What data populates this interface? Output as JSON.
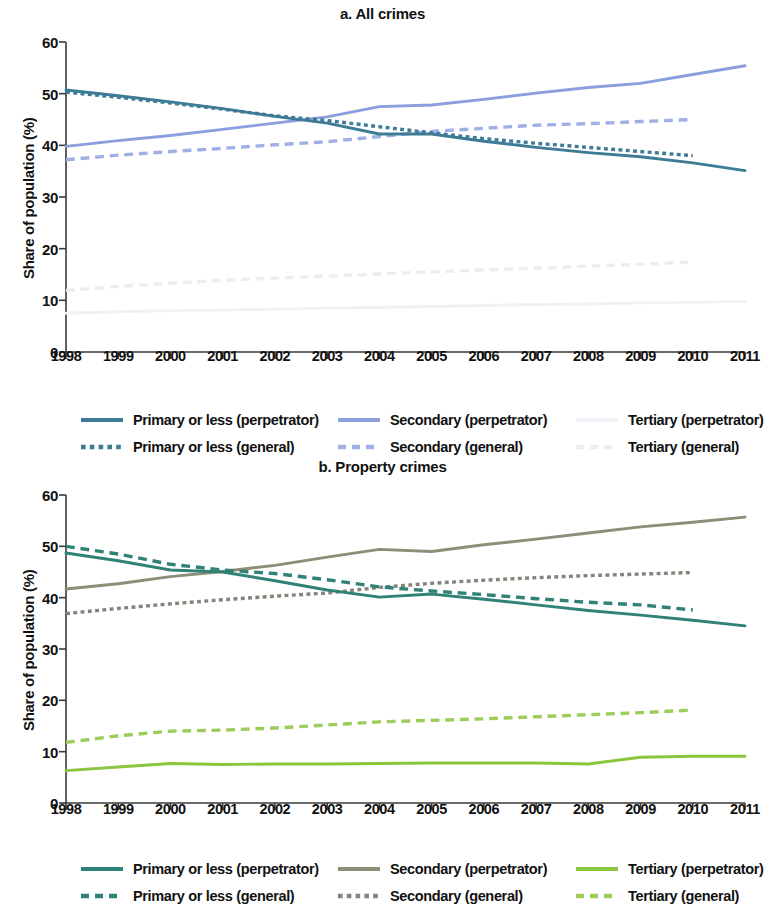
{
  "chart_data": [
    {
      "type": "line",
      "title": "a. All crimes",
      "xlabel": "",
      "ylabel": "Share of population (%)",
      "ylim": [
        0,
        60
      ],
      "yticks": [
        0,
        10,
        20,
        30,
        40,
        50,
        60
      ],
      "xlim": [
        1998,
        2011
      ],
      "categories": [
        "1998",
        "1999",
        "2000",
        "2001",
        "2002",
        "2003",
        "2004",
        "2005",
        "2006",
        "2007",
        "2008",
        "2009",
        "2010",
        "2011"
      ],
      "grid": false,
      "legend_position": "bottom",
      "colors": {
        "primary_perpetrator": "#3d7b96",
        "primary_general": "#3d7b96",
        "secondary_perpetrator": "#8b9ede",
        "secondary_general": "#9fb0e6",
        "tertiary_perpetrator": "#eef2f7",
        "tertiary_general": "#eaeef4"
      },
      "series": [
        {
          "name": "Primary or less (perpetrator)",
          "style": "solid",
          "color": "#3d7b96",
          "x": [
            1998,
            1999,
            2000,
            2001,
            2002,
            2003,
            2004,
            2005,
            2006,
            2007,
            2008,
            2009,
            2010,
            2011
          ],
          "values": [
            50.7,
            49.6,
            48.4,
            47.1,
            45.6,
            44.3,
            42.2,
            42.2,
            40.8,
            39.6,
            38.6,
            37.8,
            36.6,
            35.1
          ]
        },
        {
          "name": "Primary or less (general)",
          "style": "dotted",
          "color": "#3d7b96",
          "x": [
            1998,
            1999,
            2000,
            2001,
            2002,
            2003,
            2004,
            2005,
            2006,
            2007,
            2008,
            2009,
            2010
          ],
          "values": [
            50.3,
            49.3,
            48.2,
            47.0,
            45.7,
            44.8,
            43.6,
            42.4,
            41.3,
            40.4,
            39.6,
            38.8,
            38.0
          ]
        },
        {
          "name": "Secondary (perpetrator)",
          "style": "solid",
          "color": "#8b9ede",
          "x": [
            1998,
            1999,
            2000,
            2001,
            2002,
            2003,
            2004,
            2005,
            2006,
            2007,
            2008,
            2009,
            2010,
            2011
          ],
          "values": [
            39.8,
            40.9,
            41.9,
            43.1,
            44.3,
            45.5,
            47.5,
            47.8,
            48.9,
            50.1,
            51.2,
            52.0,
            53.7,
            55.4
          ]
        },
        {
          "name": "Secondary (general)",
          "style": "dashed",
          "color": "#9fb0e6",
          "x": [
            1998,
            1999,
            2000,
            2001,
            2002,
            2003,
            2004,
            2005,
            2006,
            2007,
            2008,
            2009,
            2010
          ],
          "values": [
            37.2,
            38.1,
            38.8,
            39.4,
            40.1,
            40.7,
            41.7,
            42.7,
            43.3,
            43.9,
            44.2,
            44.6,
            45.0
          ]
        },
        {
          "name": "Tertiary (perpetrator)",
          "style": "solid",
          "color": "#eef2f7",
          "x": [
            1998,
            1999,
            2000,
            2001,
            2002,
            2003,
            2004,
            2005,
            2006,
            2007,
            2008,
            2009,
            2010,
            2011
          ],
          "values": [
            7.5,
            7.8,
            8.0,
            8.1,
            8.3,
            8.5,
            8.6,
            8.8,
            9.0,
            9.2,
            9.3,
            9.5,
            9.6,
            9.8
          ]
        },
        {
          "name": "Tertiary (general)",
          "style": "dashed",
          "color": "#eaeef4",
          "x": [
            1998,
            1999,
            2000,
            2001,
            2002,
            2003,
            2004,
            2005,
            2006,
            2007,
            2008,
            2009,
            2010
          ],
          "values": [
            11.9,
            12.7,
            13.3,
            13.9,
            14.3,
            14.7,
            15.1,
            15.5,
            15.9,
            16.2,
            16.6,
            17.0,
            17.4
          ]
        }
      ]
    },
    {
      "type": "line",
      "title": "b. Property crimes",
      "xlabel": "",
      "ylabel": "Share of population (%)",
      "ylim": [
        0,
        60
      ],
      "yticks": [
        0,
        10,
        20,
        30,
        40,
        50,
        60
      ],
      "xlim": [
        1998,
        2011
      ],
      "categories": [
        "1998",
        "1999",
        "2000",
        "2001",
        "2002",
        "2003",
        "2004",
        "2005",
        "2006",
        "2007",
        "2008",
        "2009",
        "2010",
        "2011"
      ],
      "grid": false,
      "legend_position": "bottom",
      "colors": {
        "primary_perpetrator": "#2f8275",
        "primary_general": "#2f8275",
        "secondary_perpetrator": "#8d8d78",
        "secondary_general": "#84847a",
        "tertiary_perpetrator": "#8cc63f",
        "tertiary_general": "#9ccd5a"
      },
      "series": [
        {
          "name": "Primary or less (perpetrator)",
          "style": "solid",
          "color": "#2f8275",
          "x": [
            1998,
            1999,
            2000,
            2001,
            2002,
            2003,
            2004,
            2005,
            2006,
            2007,
            2008,
            2009,
            2010,
            2011
          ],
          "values": [
            48.7,
            47.2,
            45.4,
            45.0,
            43.3,
            41.5,
            40.1,
            40.7,
            39.7,
            38.6,
            37.5,
            36.6,
            35.6,
            34.5
          ]
        },
        {
          "name": "Primary or less (general)",
          "style": "dashed",
          "color": "#2f8275",
          "x": [
            1998,
            1999,
            2000,
            2001,
            2002,
            2003,
            2004,
            2005,
            2006,
            2007,
            2008,
            2009,
            2010
          ],
          "values": [
            50.0,
            48.5,
            46.5,
            45.4,
            44.7,
            43.5,
            42.1,
            41.3,
            40.6,
            39.8,
            39.1,
            38.6,
            37.6
          ]
        },
        {
          "name": "Secondary (perpetrator)",
          "style": "solid",
          "color": "#8d8d78",
          "x": [
            1998,
            1999,
            2000,
            2001,
            2002,
            2003,
            2004,
            2005,
            2006,
            2007,
            2008,
            2009,
            2010,
            2011
          ],
          "values": [
            41.7,
            42.7,
            44.1,
            45.1,
            46.3,
            47.9,
            49.4,
            49.0,
            50.3,
            51.4,
            52.6,
            53.8,
            54.7,
            55.7
          ]
        },
        {
          "name": "Secondary (general)",
          "style": "dotted",
          "color": "#84847a",
          "x": [
            1998,
            1999,
            2000,
            2001,
            2002,
            2003,
            2004,
            2005,
            2006,
            2007,
            2008,
            2009,
            2010
          ],
          "values": [
            36.9,
            37.9,
            38.8,
            39.6,
            40.3,
            40.9,
            42.0,
            42.8,
            43.4,
            43.9,
            44.3,
            44.6,
            44.9
          ]
        },
        {
          "name": "Tertiary (perpetrator)",
          "style": "solid",
          "color": "#8cc63f",
          "x": [
            1998,
            1999,
            2000,
            2001,
            2002,
            2003,
            2004,
            2005,
            2006,
            2007,
            2008,
            2009,
            2010,
            2011
          ],
          "values": [
            6.3,
            7.0,
            7.7,
            7.5,
            7.6,
            7.6,
            7.7,
            7.8,
            7.8,
            7.8,
            7.6,
            8.9,
            9.1,
            9.1
          ]
        },
        {
          "name": "Tertiary (general)",
          "style": "dashed",
          "color": "#9ccd5a",
          "x": [
            1998,
            1999,
            2000,
            2001,
            2002,
            2003,
            2004,
            2005,
            2006,
            2007,
            2008,
            2009,
            2010
          ],
          "values": [
            11.8,
            13.1,
            14.0,
            14.2,
            14.6,
            15.2,
            15.8,
            16.1,
            16.4,
            16.8,
            17.2,
            17.6,
            18.1
          ]
        }
      ]
    }
  ],
  "panel_a": {
    "title": "a. All crimes",
    "ylabel": "Share of population (%)",
    "yticks": [
      "60",
      "50",
      "40",
      "30",
      "20",
      "10",
      "0"
    ],
    "xticks": [
      "1998",
      "1999",
      "2000",
      "2001",
      "2002",
      "2003",
      "2004",
      "2005",
      "2006",
      "2007",
      "2008",
      "2009",
      "2010",
      "2011"
    ],
    "legend": [
      {
        "label": "Primary or less (perpetrator)",
        "color": "#3d7b96",
        "style": "solid"
      },
      {
        "label": "Secondary (perpetrator)",
        "color": "#8b9ede",
        "style": "solid"
      },
      {
        "label": "Tertiary (perpetrator)",
        "color": "#eef2f7",
        "style": "solid"
      },
      {
        "label": "Primary or less (general)",
        "color": "#3d7b96",
        "style": "dotted"
      },
      {
        "label": "Secondary (general)",
        "color": "#9fb0e6",
        "style": "dashed"
      },
      {
        "label": "Tertiary (general)",
        "color": "#eaeef4",
        "style": "dashed"
      }
    ]
  },
  "panel_b": {
    "title": "b. Property crimes",
    "ylabel": "Share of population (%)",
    "yticks": [
      "60",
      "50",
      "40",
      "30",
      "20",
      "10",
      "0"
    ],
    "xticks": [
      "1998",
      "1999",
      "2000",
      "2001",
      "2002",
      "2003",
      "2004",
      "2005",
      "2006",
      "2007",
      "2008",
      "2009",
      "2010",
      "2011"
    ],
    "legend": [
      {
        "label": "Primary or less (perpetrator)",
        "color": "#2f8275",
        "style": "solid"
      },
      {
        "label": "Secondary (perpetrator)",
        "color": "#8d8d78",
        "style": "solid"
      },
      {
        "label": "Tertiary (perpetrator)",
        "color": "#8cc63f",
        "style": "solid"
      },
      {
        "label": "Primary or less (general)",
        "color": "#2f8275",
        "style": "dashed"
      },
      {
        "label": "Secondary (general)",
        "color": "#84847a",
        "style": "dotted"
      },
      {
        "label": "Tertiary (general)",
        "color": "#9ccd5a",
        "style": "dashed"
      }
    ]
  }
}
